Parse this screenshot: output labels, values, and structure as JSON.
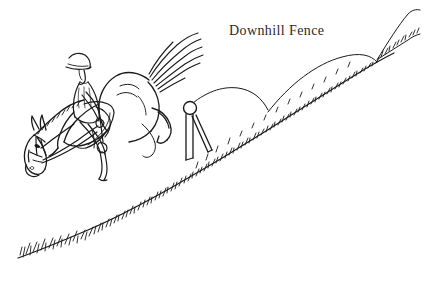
{
  "illustration": {
    "caption": "Downhill Fence",
    "subject": "horse-and-rider-jumping-downhill-fence",
    "style": "black-ink-line-drawing",
    "colors": {
      "ink": "#1a1a1a",
      "background": "#ffffff",
      "caption_text": "#2b2b2b"
    },
    "canvas": {
      "width": 426,
      "height": 281
    },
    "elements": {
      "ground_slope_label": "downhill grass slope with tufts",
      "fence_label": "single upright post fence with ball finial and diagonal brace",
      "horse_label": "horse descending slope with tail streaming up",
      "rider_label": "rider in helmet leaning back in saddle",
      "far_hill_label": "rolling background hills",
      "grass_tuft_label": "grass tuft marks"
    }
  }
}
